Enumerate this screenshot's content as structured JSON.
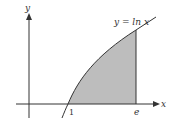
{
  "diagram": {
    "curve_label": "y = ln x",
    "x_axis_label": "x",
    "y_axis_label": "y",
    "tick_labels": [
      "1",
      "e"
    ],
    "shaded_region": "area under y = ln x from x = 1 to x = e",
    "colors": {
      "fill": "#bdbdbd",
      "stroke": "#333333"
    }
  }
}
